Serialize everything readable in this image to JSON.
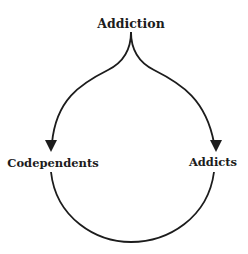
{
  "diagram": {
    "type": "cycle",
    "nodes": {
      "top": "Addiction",
      "left": "Codependents",
      "right": "Addicts"
    },
    "edges": [
      {
        "from": "Addiction",
        "to": "Codependents",
        "arrow": true
      },
      {
        "from": "Addiction",
        "to": "Addicts",
        "arrow": true
      },
      {
        "from": "Codependents",
        "to": "Addicts",
        "arrow": false
      }
    ],
    "colors": {
      "stroke": "#1c1c1c",
      "background": "#ffffff"
    }
  }
}
